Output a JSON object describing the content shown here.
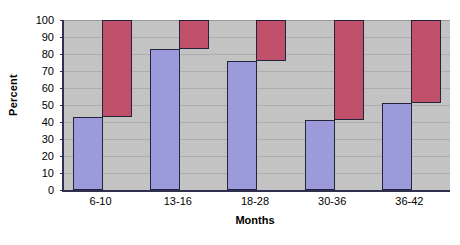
{
  "chart_data": {
    "type": "bar",
    "title": "",
    "subtitle": "",
    "xlabel": "Months",
    "ylabel": "Percent",
    "categories": [
      "6-10",
      "13-16",
      "18-28",
      "30-36",
      "36-42"
    ],
    "ylim": [
      0,
      100
    ],
    "yticks": [
      0,
      10,
      20,
      30,
      40,
      50,
      60,
      70,
      80,
      90,
      100
    ],
    "ytick_labels": [
      "0",
      "10",
      "20",
      "30",
      "40",
      "50",
      "60",
      "70",
      "80",
      "90",
      "100"
    ],
    "grid": true,
    "grid_axis": "y",
    "legend": "none",
    "bar_style": "overlapping-pair",
    "series": [
      {
        "name": "blue-series",
        "color": "#9b9bdb",
        "base": 0,
        "values": [
          43,
          83,
          76,
          41,
          51
        ]
      },
      {
        "name": "red-series",
        "color": "#c1506a",
        "base": "blue-series",
        "values": [
          57,
          17,
          24,
          59,
          49
        ],
        "tops": [
          100,
          100,
          100,
          100,
          100
        ],
        "bottoms": [
          43,
          83,
          76,
          41,
          51
        ]
      }
    ]
  },
  "axis": {
    "y_title": "Percent",
    "x_title": "Months"
  },
  "colors": {
    "plot_background": "#c3c3c3",
    "gridline": "#adadad",
    "axis_line": "#2f2f4f",
    "bar_outline": "#23233c",
    "blue": "#9b9bdb",
    "red": "#c1506a",
    "page_background": "#ffffff",
    "text": "#000000"
  }
}
